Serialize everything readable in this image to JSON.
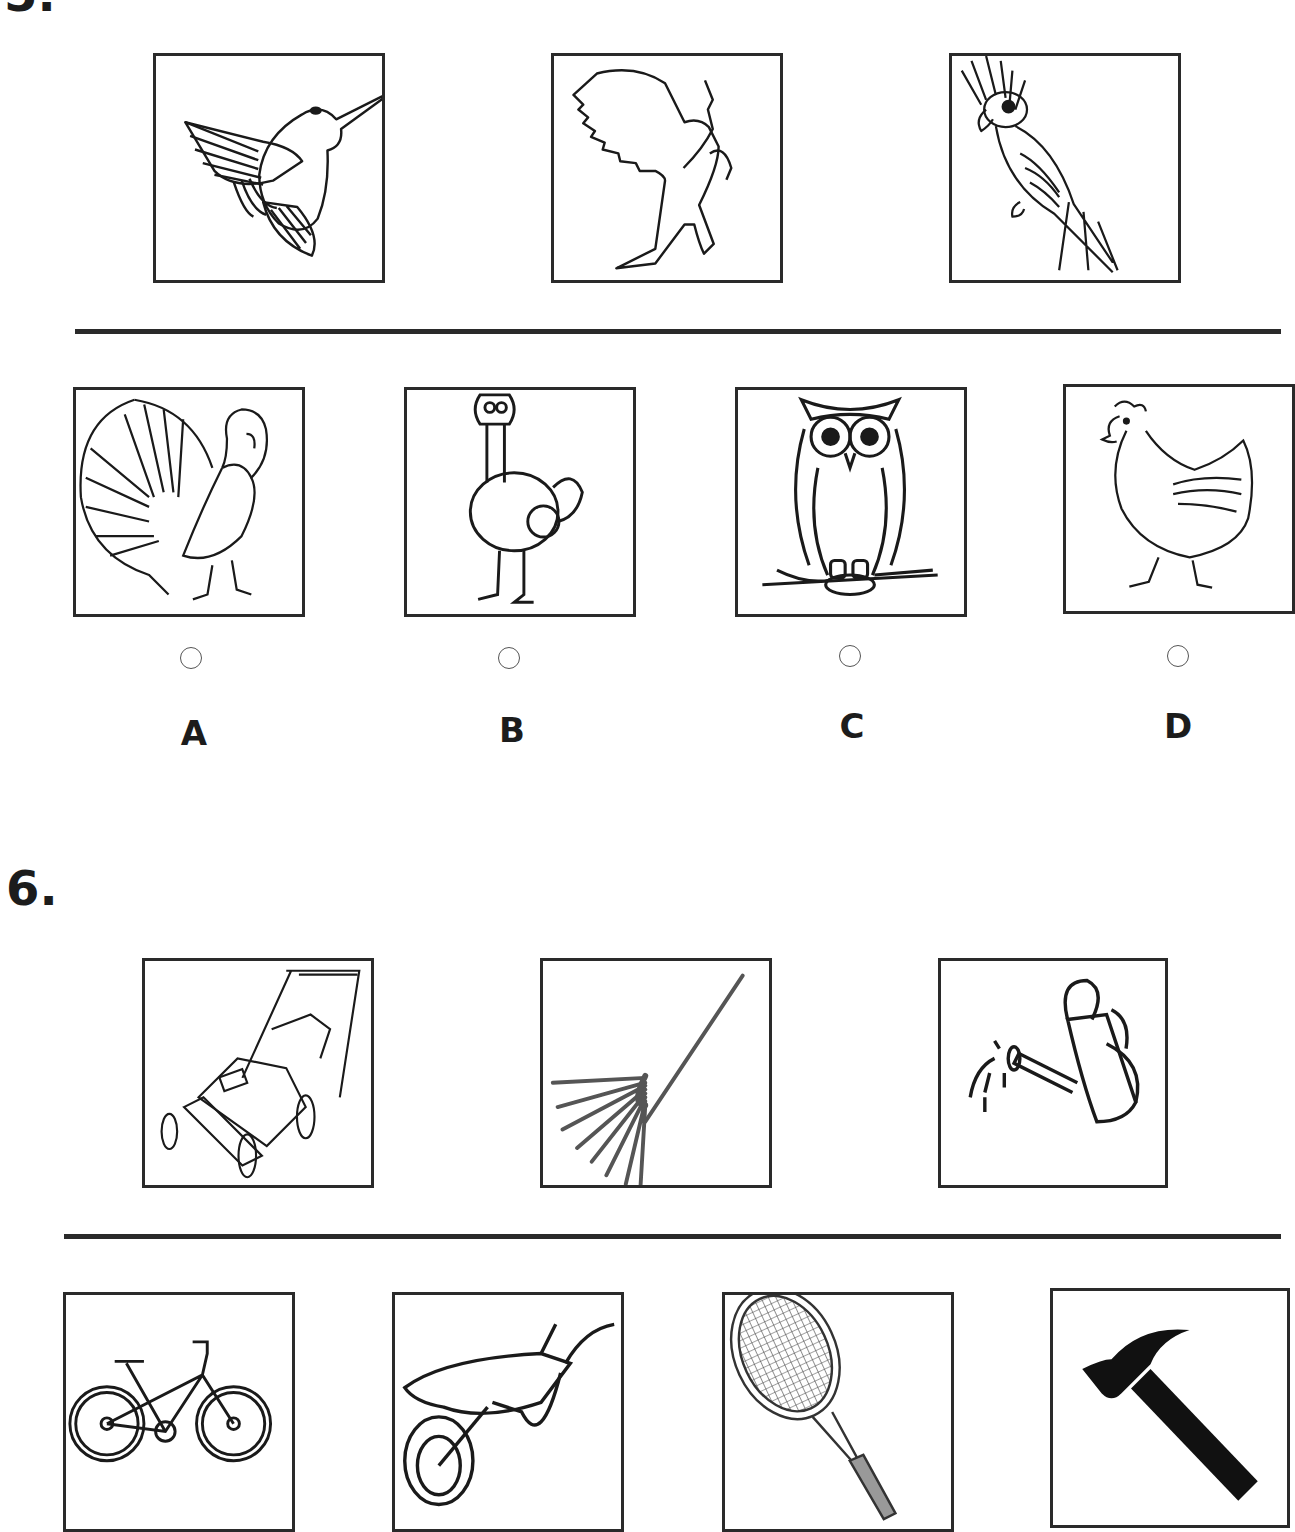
{
  "question5": {
    "number": "5.",
    "prompt_images": [
      {
        "name": "hummingbird",
        "icon": "hummingbird-icon"
      },
      {
        "name": "eagle",
        "icon": "eagle-icon"
      },
      {
        "name": "cockatoo",
        "icon": "cockatoo-icon"
      }
    ],
    "options": [
      {
        "letter": "A",
        "name": "turkey",
        "icon": "turkey-icon",
        "selected": false
      },
      {
        "letter": "B",
        "name": "ostrich",
        "icon": "ostrich-icon",
        "selected": false
      },
      {
        "letter": "C",
        "name": "owl",
        "icon": "owl-icon",
        "selected": false
      },
      {
        "letter": "D",
        "name": "hen",
        "icon": "hen-icon",
        "selected": false
      }
    ]
  },
  "question6": {
    "number": "6.",
    "prompt_images": [
      {
        "name": "lawn mower",
        "icon": "lawn-mower-icon"
      },
      {
        "name": "rake",
        "icon": "rake-icon"
      },
      {
        "name": "watering can",
        "icon": "watering-can-icon"
      }
    ],
    "options": [
      {
        "name": "bicycle",
        "icon": "bicycle-icon"
      },
      {
        "name": "wheelbarrow",
        "icon": "wheelbarrow-icon"
      },
      {
        "name": "tennis racket",
        "icon": "tennis-racket-icon"
      },
      {
        "name": "hammer",
        "icon": "hammer-icon"
      }
    ]
  }
}
